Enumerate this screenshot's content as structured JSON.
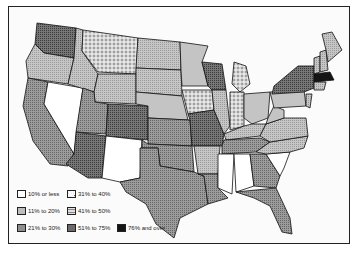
{
  "legend": {
    "items": [
      {
        "label": "10% or less",
        "fill": "#ffffff",
        "pattern": "blank"
      },
      {
        "label": "31% to 40%",
        "fill": "#dcdcdc",
        "pattern": "dots"
      },
      {
        "label": "11% to 20%",
        "fill": "#bdbdbd",
        "pattern": "light-stipple"
      },
      {
        "label": "41% to 50%",
        "fill": "#cfcfcf",
        "pattern": "horizontal-lines"
      },
      {
        "label": "21% to 30%",
        "fill": "#8e8e8e",
        "pattern": "medium-stipple"
      },
      {
        "label": "51% to 75%",
        "fill": "#6a6a6a",
        "pattern": "dark-stipple"
      },
      {
        "label": "76% and over",
        "fill": "#151515",
        "pattern": "solid"
      }
    ]
  },
  "map": {
    "region": "Contiguous United States",
    "classes": {
      "10% or less": [
        "Nevada",
        "New Mexico",
        "Mississippi",
        "Alabama",
        "South Carolina"
      ],
      "11% to 20%": [
        "Idaho",
        "Oregon",
        "North Dakota",
        "South Dakota",
        "Wyoming",
        "Illinois",
        "Arkansas",
        "Kentucky",
        "Virginia",
        "North Carolina",
        "Maine",
        "New Hampshire",
        "Vermont"
      ],
      "21% to 30%": [
        "California",
        "Utah",
        "Kansas",
        "Oklahoma",
        "Texas",
        "Louisiana",
        "Tennessee",
        "Georgia",
        "Florida"
      ],
      "31% to 40%": [
        "Montana",
        "Iowa",
        "Indiana",
        "Michigan"
      ],
      "41% to 50%": [
        "Minnesota",
        "Nebraska",
        "Ohio",
        "Pennsylvania",
        "West Virginia"
      ],
      "51% to 75%": [
        "Washington",
        "Colorado",
        "Arizona",
        "Missouri",
        "Wisconsin",
        "New York"
      ],
      "76% and over": [
        "Massachusetts"
      ]
    }
  }
}
